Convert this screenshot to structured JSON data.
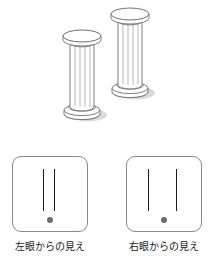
{
  "figure": {
    "title_visible": false,
    "topic": "binocular-disparity-two-pillars"
  },
  "scene": {
    "objects": [
      {
        "name": "near-pillar",
        "label": "",
        "position": "left-lower",
        "cx": 82,
        "top_y": 30,
        "bottom_y": 118,
        "shaft_width": 22,
        "cap_rx": 19,
        "flutes": 4
      },
      {
        "name": "far-pillar",
        "label": "",
        "position": "right-upper",
        "cx": 130,
        "top_y": 8,
        "bottom_y": 96,
        "shaft_width": 22,
        "cap_rx": 19,
        "flutes": 4
      }
    ],
    "stroke_color": "#6f6f6f",
    "fill_color": "#ffffff",
    "shadow_color": "#cfcfcf"
  },
  "views": [
    {
      "name": "left-eye-view",
      "caption": "左眼からの見え",
      "bars": [
        {
          "name": "near-pillar-image",
          "x_percent": 40,
          "top": 12,
          "height": 42
        },
        {
          "name": "far-pillar-image",
          "x_percent": 55,
          "top": 12,
          "height": 42
        }
      ],
      "fixation_dot": {
        "name": "fixation-dot",
        "color": "#6b6b6b",
        "size": 6
      },
      "separation_px": 11
    },
    {
      "name": "right-eye-view",
      "caption": "右眼からの見え",
      "bars": [
        {
          "name": "near-pillar-image",
          "x_percent": 28,
          "top": 12,
          "height": 42
        },
        {
          "name": "far-pillar-image",
          "x_percent": 66,
          "top": 12,
          "height": 42
        }
      ],
      "fixation_dot": {
        "name": "fixation-dot",
        "color": "#6b6b6b",
        "size": 6
      },
      "separation_px": 29
    }
  ],
  "colors": {
    "panel_border": "#8a8a8a",
    "bar": "#1a1a1a",
    "dot": "#6b6b6b",
    "outline": "#6f6f6f",
    "text": "#1a1a1a",
    "background": "#ffffff"
  }
}
